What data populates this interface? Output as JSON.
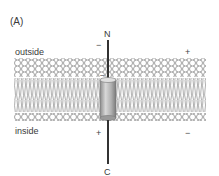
{
  "panel_label": "(A)",
  "labels": {
    "outside": "outside",
    "inside": "inside",
    "n_terminus": "N",
    "c_terminus": "C"
  },
  "charges": {
    "outside_near_helix": "−",
    "outside_right": "+",
    "inside_near_helix": "+",
    "inside_right": "−",
    "helix_top_in_membrane": "−"
  },
  "colors": {
    "lipid_stroke": "#8a8a8a",
    "helix_fill": "#bdbdbd",
    "helix_dark": "#777777",
    "chain": "#333333"
  }
}
